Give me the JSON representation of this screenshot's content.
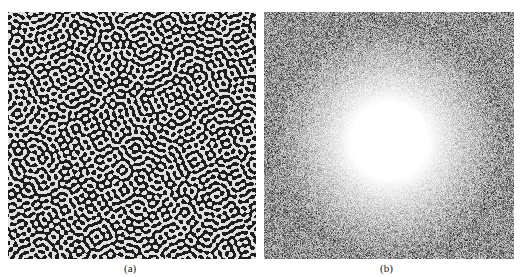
{
  "figure": {
    "panels": [
      {
        "id": "a",
        "caption": "(a)",
        "description": "Labyrinthine black-and-white stripe pattern (Turing-like texture)",
        "colors": {
          "dark": "#1e1e1e",
          "light": "#e6e6e6"
        }
      },
      {
        "id": "b",
        "caption": "(b)",
        "description": "Grayscale noise with bright circular ring/halo in center (Fourier spectrum)",
        "colors": {
          "dark": "#555555",
          "light": "#ffffff"
        }
      }
    ]
  }
}
